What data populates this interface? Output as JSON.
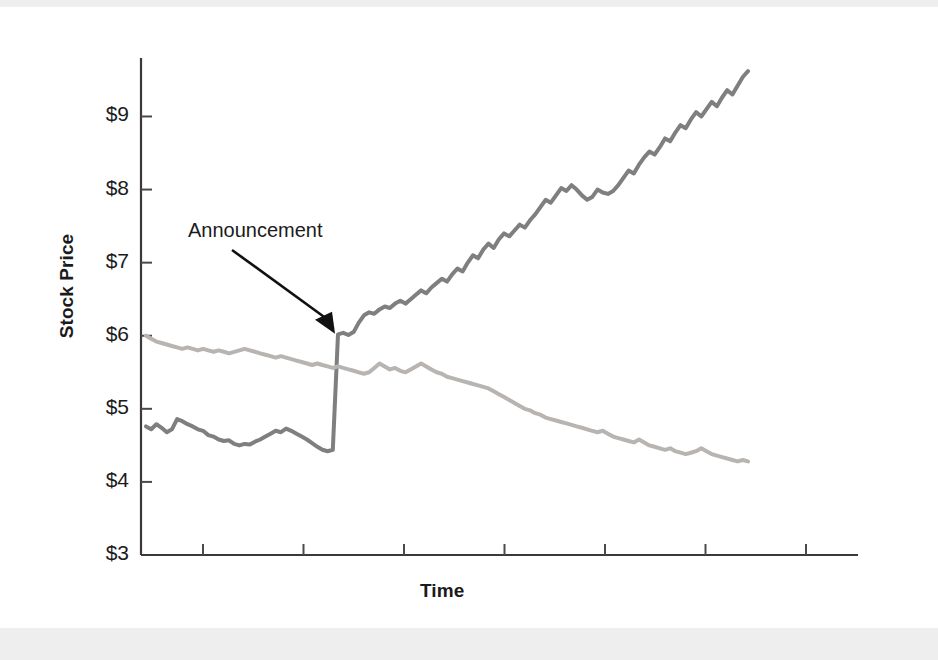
{
  "figure": {
    "background_color": "#ffffff",
    "page_margin_color": "#eeeeef"
  },
  "chart_data": {
    "type": "line",
    "title": "",
    "xlabel": "Time",
    "ylabel": "Stock Price",
    "ylim": [
      3,
      9.8
    ],
    "ytick_labels": [
      "$9",
      "$8",
      "$7",
      "$6",
      "$5",
      "$4",
      "$3"
    ],
    "ytick_values": [
      9,
      8,
      7,
      6,
      5,
      4,
      3
    ],
    "xtick_count": 7,
    "xtick_labels": [
      "",
      "",
      "",
      "",
      "",
      "",
      ""
    ],
    "grid": false,
    "legend": false,
    "annotations": [
      {
        "text": "Announcement",
        "kind": "arrow-label",
        "points_to_x_index": 37,
        "points_to_value": 6.0
      }
    ],
    "series": [
      {
        "name": "good-news-path",
        "color": "#7f7f7f",
        "linewidth": 4,
        "values": [
          4.76,
          4.72,
          4.79,
          4.74,
          4.68,
          4.72,
          4.86,
          4.83,
          4.79,
          4.76,
          4.72,
          4.7,
          4.64,
          4.62,
          4.58,
          4.56,
          4.57,
          4.52,
          4.5,
          4.52,
          4.51,
          4.55,
          4.58,
          4.62,
          4.66,
          4.7,
          4.68,
          4.73,
          4.7,
          4.66,
          4.62,
          4.58,
          4.53,
          4.48,
          4.44,
          4.42,
          4.44,
          6.02,
          6.04,
          6.01,
          6.05,
          6.18,
          6.28,
          6.32,
          6.3,
          6.36,
          6.4,
          6.38,
          6.44,
          6.48,
          6.44,
          6.5,
          6.56,
          6.62,
          6.58,
          6.66,
          6.72,
          6.78,
          6.74,
          6.84,
          6.92,
          6.88,
          7.0,
          7.1,
          7.06,
          7.18,
          7.26,
          7.2,
          7.32,
          7.4,
          7.36,
          7.44,
          7.52,
          7.48,
          7.58,
          7.66,
          7.76,
          7.86,
          7.82,
          7.92,
          8.02,
          7.98,
          8.06,
          8.0,
          7.92,
          7.86,
          7.9,
          8.0,
          7.96,
          7.94,
          7.98,
          8.06,
          8.16,
          8.26,
          8.22,
          8.34,
          8.44,
          8.52,
          8.48,
          8.58,
          8.7,
          8.66,
          8.78,
          8.88,
          8.84,
          8.96,
          9.06,
          9.0,
          9.1,
          9.2,
          9.14,
          9.26,
          9.36,
          9.3,
          9.42,
          9.54,
          9.62
        ]
      },
      {
        "name": "bad-news-path",
        "color": "#b7b4b1",
        "linewidth": 4,
        "values": [
          6.0,
          5.96,
          5.92,
          5.9,
          5.88,
          5.86,
          5.84,
          5.82,
          5.84,
          5.82,
          5.8,
          5.82,
          5.8,
          5.78,
          5.8,
          5.78,
          5.76,
          5.78,
          5.8,
          5.82,
          5.8,
          5.78,
          5.76,
          5.74,
          5.72,
          5.7,
          5.72,
          5.7,
          5.68,
          5.66,
          5.64,
          5.62,
          5.6,
          5.62,
          5.6,
          5.58,
          5.56,
          5.58,
          5.56,
          5.54,
          5.52,
          5.5,
          5.48,
          5.5,
          5.56,
          5.62,
          5.58,
          5.54,
          5.56,
          5.52,
          5.5,
          5.54,
          5.58,
          5.62,
          5.58,
          5.54,
          5.5,
          5.48,
          5.44,
          5.42,
          5.4,
          5.38,
          5.36,
          5.34,
          5.32,
          5.3,
          5.28,
          5.24,
          5.2,
          5.16,
          5.12,
          5.08,
          5.04,
          5.0,
          4.98,
          4.94,
          4.92,
          4.88,
          4.86,
          4.84,
          4.82,
          4.8,
          4.78,
          4.76,
          4.74,
          4.72,
          4.7,
          4.68,
          4.7,
          4.66,
          4.62,
          4.6,
          4.58,
          4.56,
          4.54,
          4.58,
          4.54,
          4.5,
          4.48,
          4.46,
          4.44,
          4.46,
          4.42,
          4.4,
          4.38,
          4.4,
          4.42,
          4.46,
          4.42,
          4.38,
          4.36,
          4.34,
          4.32,
          4.3,
          4.28,
          4.3,
          4.28
        ]
      }
    ]
  }
}
